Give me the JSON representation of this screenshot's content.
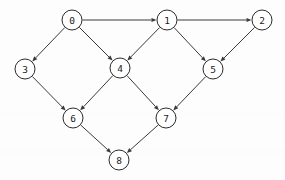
{
  "diagram": {
    "type": "directed-graph",
    "canvas": {
      "width": 285,
      "height": 180
    },
    "style": {
      "background_color": "#fdfdfd",
      "node_fill": "#ffffff",
      "node_stroke": "#2b2b2b",
      "edge_color": "#3a3a3a",
      "label_color": "#1a1a1a",
      "node_radius": 10,
      "arrow_size": 5
    },
    "nodes": [
      {
        "id": "0",
        "label": "0",
        "x": 72,
        "y": 20
      },
      {
        "id": "1",
        "label": "1",
        "x": 167,
        "y": 20
      },
      {
        "id": "2",
        "label": "2",
        "x": 262,
        "y": 20
      },
      {
        "id": "3",
        "label": "3",
        "x": 25,
        "y": 69
      },
      {
        "id": "4",
        "label": "4",
        "x": 120,
        "y": 68
      },
      {
        "id": "5",
        "label": "5",
        "x": 213,
        "y": 69
      },
      {
        "id": "6",
        "label": "6",
        "x": 73,
        "y": 118
      },
      {
        "id": "7",
        "label": "7",
        "x": 166,
        "y": 118
      },
      {
        "id": "8",
        "label": "8",
        "x": 119,
        "y": 160
      }
    ],
    "edges": [
      {
        "from": "0",
        "to": "1",
        "directed": true
      },
      {
        "from": "0",
        "to": "3",
        "directed": true
      },
      {
        "from": "0",
        "to": "4",
        "directed": true
      },
      {
        "from": "1",
        "to": "2",
        "directed": true
      },
      {
        "from": "1",
        "to": "4",
        "directed": true
      },
      {
        "from": "1",
        "to": "5",
        "directed": true
      },
      {
        "from": "2",
        "to": "5",
        "directed": true
      },
      {
        "from": "3",
        "to": "6",
        "directed": true
      },
      {
        "from": "4",
        "to": "6",
        "directed": true
      },
      {
        "from": "4",
        "to": "7",
        "directed": true
      },
      {
        "from": "5",
        "to": "7",
        "directed": true
      },
      {
        "from": "6",
        "to": "8",
        "directed": true
      },
      {
        "from": "7",
        "to": "8",
        "directed": true
      }
    ],
    "bands": [
      {
        "y": 112,
        "height": 6
      },
      {
        "y": 148,
        "height": 6
      }
    ]
  }
}
